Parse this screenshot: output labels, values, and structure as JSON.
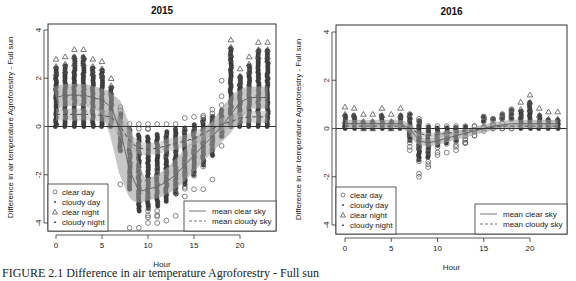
{
  "caption": "FIGURE 2.1   Difference in air temperature Agroforestry - Full sun",
  "chart_data": [
    {
      "type": "scatter",
      "title": "2015",
      "xlabel": "Hour",
      "ylabel": "Difference in air temperature Agroforestry - Full sun",
      "xlim": [
        -0.5,
        24
      ],
      "ylim": [
        -4.2,
        4.2
      ],
      "xticks": [
        0,
        5,
        10,
        15,
        20
      ],
      "yticks": [
        -4,
        -2,
        0,
        2,
        4
      ],
      "hline": 0,
      "legend_points": [
        "clear day",
        "cloudy day",
        "clear night",
        "cloudy night"
      ],
      "legend_lines": [
        "mean clear sky",
        "mean cloudy sky"
      ],
      "hours": [
        0,
        1,
        2,
        3,
        4,
        5,
        6,
        7,
        8,
        9,
        10,
        11,
        12,
        13,
        14,
        15,
        16,
        17,
        18,
        19,
        20,
        21,
        22,
        23
      ],
      "series": [
        {
          "name": "mean clear sky",
          "style": "solid",
          "values": [
            1.2,
            1.3,
            1.3,
            1.3,
            1.2,
            1.1,
            0.8,
            -0.2,
            -1.8,
            -2.7,
            -2.6,
            -2.5,
            -2.3,
            -2.0,
            -1.6,
            -1.2,
            -0.8,
            -0.4,
            0.0,
            0.5,
            1.0,
            1.2,
            1.2,
            1.2
          ]
        },
        {
          "name": "mean cloudy sky",
          "style": "dashed",
          "values": [
            0.5,
            0.5,
            0.5,
            0.5,
            0.5,
            0.45,
            0.4,
            0.0,
            -0.6,
            -0.9,
            -0.95,
            -0.9,
            -0.8,
            -0.7,
            -0.6,
            -0.5,
            -0.3,
            -0.1,
            0.1,
            0.2,
            0.35,
            0.4,
            0.4,
            0.4
          ]
        },
        {
          "name": "range max",
          "values": [
            2.8,
            2.9,
            3.2,
            3.2,
            2.8,
            2.7,
            2.0,
            0.8,
            0.1,
            0.1,
            0.1,
            0.1,
            0.1,
            0.1,
            0.35,
            0.4,
            0.45,
            0.7,
            1.9,
            3.6,
            2.4,
            2.9,
            3.5,
            3.5
          ]
        },
        {
          "name": "range min",
          "values": [
            0.0,
            0.0,
            0.0,
            0.0,
            0.0,
            0.0,
            0.0,
            -2.4,
            -4.2,
            -4.2,
            -4.0,
            -4.0,
            -3.9,
            -3.7,
            -2.9,
            -2.6,
            -2.6,
            -2.2,
            -0.8,
            -0.2,
            0.0,
            0.0,
            0.0,
            0.0
          ]
        }
      ]
    },
    {
      "type": "scatter",
      "title": "2016",
      "xlabel": "Hour",
      "ylabel": "Difference in air temperature Agroforestry - Full sun",
      "xlim": [
        -0.5,
        24
      ],
      "ylim": [
        -4.2,
        4.2
      ],
      "xticks": [
        0,
        5,
        10,
        15,
        20
      ],
      "yticks": [
        -4,
        -2,
        0,
        2,
        4
      ],
      "hline": 0,
      "legend_points": [
        "clear day",
        "cloudy day",
        "clear night",
        "cloudy night"
      ],
      "legend_lines": [
        "mean clear sky",
        "mean cloudy sky"
      ],
      "hours": [
        0,
        1,
        2,
        3,
        4,
        5,
        6,
        7,
        8,
        9,
        10,
        11,
        12,
        13,
        14,
        15,
        16,
        17,
        18,
        19,
        20,
        21,
        22,
        23
      ],
      "series": [
        {
          "name": "mean clear sky",
          "style": "solid",
          "values": [
            0.2,
            0.2,
            0.2,
            0.2,
            0.2,
            0.2,
            0.2,
            0.0,
            -0.5,
            -0.6,
            -0.5,
            -0.4,
            -0.3,
            -0.2,
            -0.1,
            0.0,
            0.1,
            0.15,
            0.2,
            0.2,
            0.2,
            0.2,
            0.2,
            0.2
          ]
        },
        {
          "name": "mean cloudy sky",
          "style": "dashed",
          "values": [
            0.1,
            0.1,
            0.1,
            0.1,
            0.1,
            0.1,
            0.1,
            0.0,
            -0.2,
            -0.3,
            -0.25,
            -0.2,
            -0.15,
            -0.1,
            -0.05,
            0.0,
            0.05,
            0.1,
            0.1,
            0.1,
            0.1,
            0.1,
            0.1,
            0.1
          ]
        },
        {
          "name": "range max",
          "values": [
            0.9,
            0.85,
            0.6,
            0.6,
            0.85,
            0.6,
            0.85,
            0.6,
            0.4,
            0.1,
            0.1,
            0.1,
            0.1,
            0.1,
            0.1,
            0.5,
            0.4,
            0.6,
            0.8,
            1.1,
            1.4,
            0.85,
            0.7,
            0.7
          ]
        },
        {
          "name": "range min",
          "values": [
            0.0,
            0.0,
            0.0,
            0.0,
            0.0,
            0.0,
            0.0,
            -0.9,
            -2.0,
            -1.6,
            -1.1,
            -1.0,
            -0.9,
            -0.6,
            -0.3,
            -0.1,
            0.0,
            0.0,
            0.0,
            0.0,
            0.0,
            0.0,
            0.0,
            0.0
          ]
        }
      ]
    }
  ]
}
